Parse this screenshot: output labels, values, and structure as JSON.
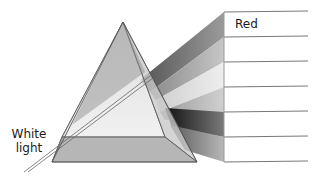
{
  "diagram": {
    "labels": {
      "input": [
        "White",
        "light"
      ],
      "top_band": "Red"
    },
    "band_count": 6,
    "band_shades": [
      "#8a8a8a",
      "#b5b5b5",
      "#dcdcdc",
      "#a8a8a8",
      "#3a3a3a",
      "#9a9a9a"
    ],
    "colors": {
      "prism_edge": "#555555",
      "line": "#777777",
      "text": "#1a1a1a"
    }
  }
}
